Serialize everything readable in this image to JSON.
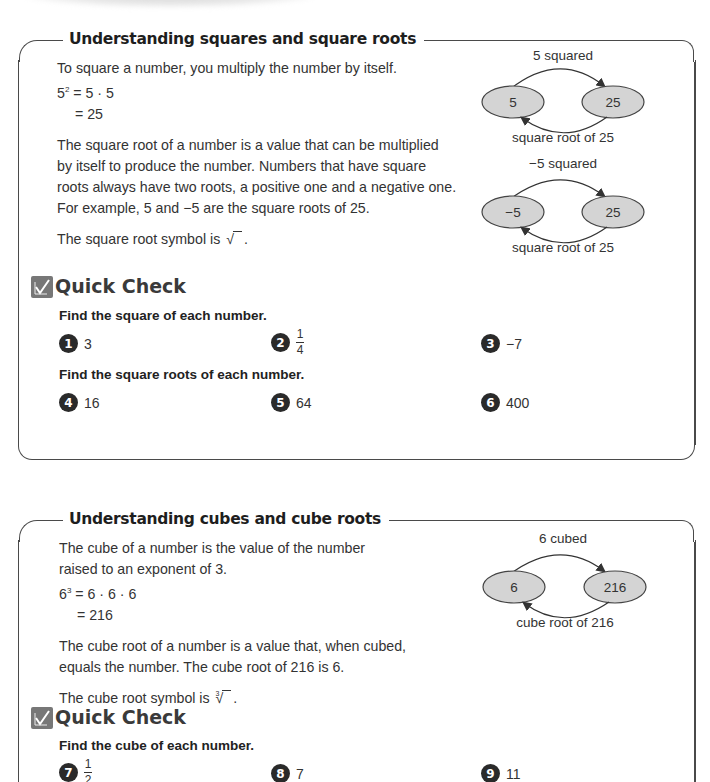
{
  "sections": [
    {
      "title": "Understanding squares and square roots",
      "intro": "To square a number, you multiply the number by itself.",
      "equation": {
        "base": "5",
        "exponent": "2",
        "line1_rhs": "= 5 · 5",
        "line2": "= 25"
      },
      "paragraph": [
        "The square root of a number is a value that can be multiplied",
        "by itself to produce the number. Numbers that have square",
        "roots always have two roots, a positive one and a negative one.",
        "For example, 5 and −5 are the square roots of 25."
      ],
      "symbol_text": "The square root symbol is",
      "symbol_glyph": "√",
      "symbol_end": ".",
      "diagrams": [
        {
          "top_label": "5 squared",
          "left": "5",
          "right": "25",
          "bottom_label": "square root of 25"
        },
        {
          "top_label": "−5 squared",
          "left": "−5",
          "right": "25",
          "bottom_label": "square root of 25"
        }
      ],
      "quick_check": {
        "title": "Quick Check",
        "groups": [
          {
            "instruction": "Find the square of each number.",
            "items": [
              {
                "num": "1",
                "value": "3"
              },
              {
                "num": "2",
                "numerator": "1",
                "denominator": "4"
              },
              {
                "num": "3",
                "value": "−7"
              }
            ]
          },
          {
            "instruction": "Find the square roots of each number.",
            "items": [
              {
                "num": "4",
                "value": "16"
              },
              {
                "num": "5",
                "value": "64"
              },
              {
                "num": "6",
                "value": "400"
              }
            ]
          }
        ]
      }
    },
    {
      "title": "Understanding cubes and cube roots",
      "intro": [
        "The cube of a number is the value of the number",
        "raised to an exponent of 3."
      ],
      "equation": {
        "base": "6",
        "exponent": "3",
        "line1_rhs": "= 6 · 6 · 6",
        "line2": "= 216"
      },
      "paragraph": [
        "The cube root of a number is a value that, when cubed,",
        "equals the number. The cube root of 216 is 6."
      ],
      "symbol_text": "The cube root symbol is",
      "symbol_index": "3",
      "symbol_glyph": "√",
      "symbol_end": ".",
      "diagrams": [
        {
          "top_label": "6 cubed",
          "left": "6",
          "right": "216",
          "bottom_label": "cube root of 216"
        }
      ],
      "quick_check": {
        "title": "Quick Check",
        "groups": [
          {
            "instruction": "Find the cube of each number.",
            "items": [
              {
                "num": "7",
                "numerator": "1",
                "denominator": "2"
              },
              {
                "num": "8",
                "value": "7"
              },
              {
                "num": "9",
                "value": "11"
              }
            ]
          }
        ]
      }
    }
  ],
  "colors": {
    "ellipse_fill": "#d4d4d4",
    "frame": "#4a4a4a",
    "badge": "#2a2a2a",
    "check_icon_bg": "#777777"
  }
}
